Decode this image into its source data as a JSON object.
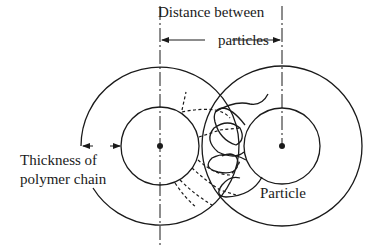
{
  "diagram": {
    "labels": {
      "distance_line1": "Distance between",
      "distance_line2": "particles",
      "thickness_line1": "Thickness of",
      "thickness_line2": "polymer chain",
      "particle": "Particle"
    },
    "elements": [
      {
        "id": "left-particle",
        "type": "circle",
        "role": "particle core"
      },
      {
        "id": "left-polymer-layer",
        "type": "circle",
        "role": "polymer shell"
      },
      {
        "id": "right-particle",
        "type": "circle",
        "role": "particle core"
      },
      {
        "id": "right-polymer-layer",
        "type": "circle",
        "role": "polymer shell"
      },
      {
        "id": "left-chains",
        "type": "dashed-curves",
        "role": "polymer chains (left)"
      },
      {
        "id": "right-chains",
        "type": "solid-curves",
        "role": "polymer chains (right, entangled)"
      },
      {
        "id": "distance-arrow",
        "type": "double-arrow",
        "role": "center-to-center distance"
      },
      {
        "id": "thickness-arrows",
        "type": "arrows",
        "role": "shell thickness"
      }
    ],
    "colors": {
      "stroke": "#1a1a1a",
      "background": "#ffffff"
    }
  }
}
